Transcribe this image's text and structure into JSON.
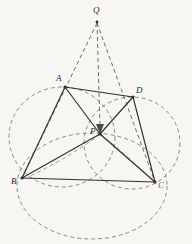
{
  "figure": {
    "canvas": {
      "width": 192,
      "height": 244,
      "background": "#f7f6f3"
    },
    "style": {
      "solid_stroke": "#2f2f2f",
      "dashed_stroke": "#7a7874",
      "label_color": "#2b2b2b",
      "solid_width": 1.1,
      "dashed_width": 0.9,
      "dash_pattern": "4,3"
    },
    "points": [
      {
        "name": "Q",
        "label": "Q",
        "x": 97,
        "y": 18,
        "label_x": 93,
        "label_y": 6
      },
      {
        "name": "A",
        "label": "A",
        "x": 65,
        "y": 87,
        "label_x": 56,
        "label_y": 74
      },
      {
        "name": "D",
        "label": "D",
        "x": 133,
        "y": 97,
        "label_x": 136,
        "label_y": 86
      },
      {
        "name": "B",
        "label": "B",
        "x": 22,
        "y": 178,
        "label_x": 11,
        "label_y": 177
      },
      {
        "name": "C",
        "label": "C",
        "x": 155,
        "y": 182,
        "label_x": 158,
        "label_y": 181
      },
      {
        "name": "P",
        "label": "P",
        "x": 100,
        "y": 134,
        "label_x": 90,
        "label_y": 127
      }
    ],
    "solid_segments": [
      {
        "name": "segment-A-D",
        "from": "A",
        "to": "D"
      },
      {
        "name": "segment-A-B",
        "from": "A",
        "to": "B"
      },
      {
        "name": "segment-A-P",
        "from": "A",
        "to": "P"
      },
      {
        "name": "segment-D-P",
        "from": "D",
        "to": "P"
      },
      {
        "name": "segment-D-C",
        "from": "D",
        "to": "C"
      },
      {
        "name": "segment-B-P",
        "from": "B",
        "to": "P"
      },
      {
        "name": "segment-P-C",
        "from": "P",
        "to": "C"
      },
      {
        "name": "segment-B-C",
        "from": "B",
        "to": "C"
      }
    ],
    "dashed_segments": [
      {
        "name": "dashed-Q-B",
        "x1": 97,
        "y1": 22,
        "x2": 22,
        "y2": 178
      },
      {
        "name": "dashed-Q-C",
        "x1": 97,
        "y1": 22,
        "x2": 155,
        "y2": 182
      },
      {
        "name": "dashed-Q-P",
        "x1": 97,
        "y1": 22,
        "x2": 100,
        "y2": 131
      }
    ],
    "arrow": {
      "name": "arrow-Q-to-P",
      "tip_x": 100,
      "tip_y": 133,
      "direction": "down"
    },
    "circles": [
      {
        "name": "circle-A-B-P",
        "cx": 62,
        "cy": 137,
        "rx": 53,
        "ry": 50
      },
      {
        "name": "circle-D-P-C",
        "cx": 132,
        "cy": 143,
        "rx": 48,
        "ry": 46
      },
      {
        "name": "circle-B-P-C",
        "cx": 92,
        "cy": 186,
        "rx": 75,
        "ry": 53
      }
    ]
  }
}
